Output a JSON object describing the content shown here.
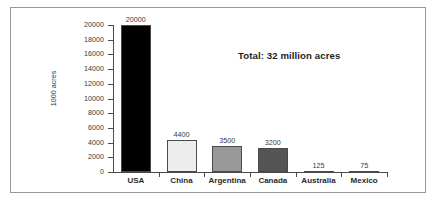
{
  "figure": {
    "frame_color": "#9a9a9a",
    "background": "#ffffff"
  },
  "annotation": {
    "total_label": "Total: 32 million acres"
  },
  "chart_data": {
    "type": "bar",
    "title": "",
    "subtitle": "",
    "xlabel": "",
    "ylabel": "1000 acres",
    "ylim": [
      0,
      20000
    ],
    "grid": false,
    "legend": "none",
    "categories": [
      "USA",
      "China",
      "Argentina",
      "Canada",
      "Australia",
      "Mexico"
    ],
    "values": [
      20000,
      4400,
      3500,
      3200,
      125,
      75
    ],
    "value_labels": [
      "20000",
      "4400",
      "3500",
      "3200",
      "125",
      "75"
    ],
    "bar_colors": [
      "#000000",
      "#ededed",
      "#999999",
      "#555555",
      "#3d3d3d",
      "#3d3d3d"
    ],
    "bar_edge_color": "#4a4a4a",
    "ytick_labels": [
      "20000",
      "18000",
      "16000",
      "14000",
      "12000",
      "10000",
      "8000",
      "6000",
      "4000",
      "2000",
      "0"
    ],
    "ytick_values": [
      20000,
      18000,
      16000,
      14000,
      12000,
      10000,
      8000,
      6000,
      4000,
      2000,
      0
    ],
    "annotations": [
      "Total: 32 million acres"
    ]
  }
}
